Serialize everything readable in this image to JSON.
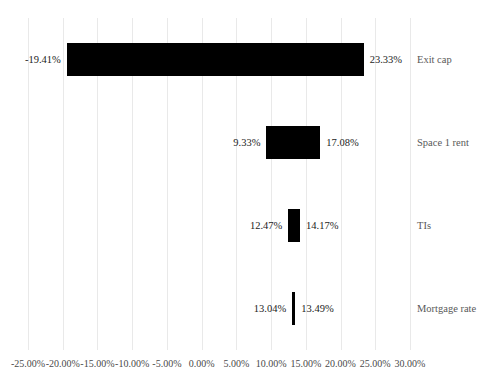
{
  "chart_data": {
    "type": "bar",
    "subtype": "tornado",
    "title": "",
    "subtitle": "",
    "xlabel": "",
    "ylabel": "",
    "orientation": "horizontal",
    "grid": true,
    "legend": false,
    "legend_position": "none",
    "bar_color": "#000000",
    "gridline_color": "#E9E9E9",
    "label_color": "#595959",
    "value_label_color": "#1C1C1C",
    "xlim": [
      -25.0,
      30.0
    ],
    "xtick_step": 5.0,
    "xtick_labels": [
      "-25.00%",
      "-20.00%",
      "-15.00%",
      "-10.00%",
      "-5.00%",
      "0.00%",
      "5.00%",
      "10.00%",
      "15.00%",
      "20.00%",
      "25.00%",
      "30.00%"
    ],
    "xtick_values": [
      -25,
      -20,
      -15,
      -10,
      -5,
      0,
      5,
      10,
      15,
      20,
      25,
      30
    ],
    "categories": [
      "Exit cap",
      "Space 1 rent",
      "TIs",
      "Mortgage rate"
    ],
    "bars": [
      {
        "category": "Exit cap",
        "low": -19.41,
        "high": 23.33,
        "low_label": "-19.41%",
        "high_label": "23.33%"
      },
      {
        "category": "Space 1 rent",
        "low": 9.33,
        "high": 17.08,
        "low_label": "9.33%",
        "high_label": "17.08%"
      },
      {
        "category": "TIs",
        "low": 12.47,
        "high": 14.17,
        "low_label": "12.47%",
        "high_label": "14.17%"
      },
      {
        "category": "Mortgage rate",
        "low": 13.04,
        "high": 13.49,
        "low_label": "13.04%",
        "high_label": "13.49%"
      }
    ]
  }
}
